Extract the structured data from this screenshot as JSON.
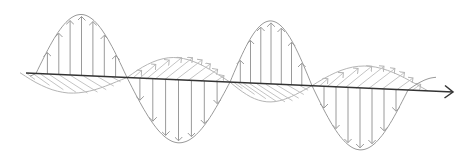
{
  "diagram": {
    "colors": {
      "axis": "#333333",
      "e_field": "#9a9a9a",
      "b_field": "#b5b5b5",
      "background": "#ffffff"
    },
    "axis": {
      "start": [
        26,
        73
      ],
      "end": [
        453,
        92
      ],
      "direction_arrow": "arrow-right"
    },
    "e_field": {
      "kind": "vertical-sine-with-arrows",
      "peaks": [
        [
          87,
          14
        ],
        [
          285,
          23
        ]
      ],
      "troughs": [
        [
          168,
          143
        ],
        [
          360,
          150
        ]
      ],
      "zero_crossings": [
        [
          36,
          74
        ],
        [
          127,
          80
        ],
        [
          230,
          84
        ],
        [
          312,
          88
        ],
        [
          408,
          91
        ]
      ]
    },
    "b_field": {
      "kind": "horizontal-sine-hatched",
      "lobes": [
        {
          "from": [
            20,
            95
          ],
          "to": [
            127,
            80
          ],
          "side": "below"
        },
        {
          "from": [
            127,
            80
          ],
          "to": [
            230,
            84
          ],
          "side": "above"
        },
        {
          "from": [
            230,
            84
          ],
          "to": [
            312,
            88
          ],
          "side": "below"
        },
        {
          "from": [
            312,
            88
          ],
          "to": [
            428,
            74
          ],
          "side": "above"
        }
      ]
    }
  }
}
